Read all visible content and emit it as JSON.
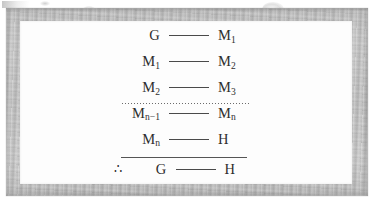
{
  "figure": {
    "kind": "derivation-chain",
    "frame_color": "#bdbdbd",
    "panel_color": "#fdfdfd",
    "ink_color": "#2e2e2e",
    "rule_color": "#555555",
    "premises": [
      {
        "left": "G",
        "left_sub": "",
        "connector": "——",
        "right": "M",
        "right_sub": "1"
      },
      {
        "left": "M",
        "left_sub": "1",
        "connector": "——",
        "right": "M",
        "right_sub": "2"
      },
      {
        "left": "M",
        "left_sub": "2",
        "connector": "——",
        "right": "M",
        "right_sub": "3"
      },
      {
        "left": "M",
        "left_sub": "n−1",
        "connector": "——",
        "right": "M",
        "right_sub": "n"
      },
      {
        "left": "M",
        "left_sub": "n",
        "connector": "——",
        "right": "H",
        "right_sub": ""
      }
    ],
    "ellipsis_separator": "············",
    "conclusion": {
      "therefore": "∴",
      "left": "G",
      "left_sub": "",
      "connector": "——",
      "right": "H",
      "right_sub": ""
    }
  }
}
